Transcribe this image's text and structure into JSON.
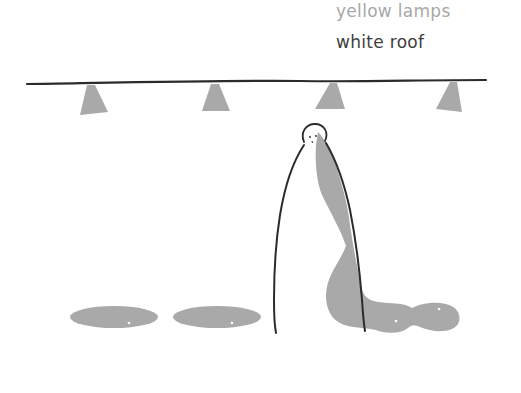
{
  "labels": {
    "yellow_lamps": "yellow lamps",
    "white_roof": "white roof"
  },
  "colors": {
    "ink": "#2b2b2b",
    "shade": "#a9a9a9",
    "label_light": "#a7a7a7",
    "label_dark": "#3d3d3d",
    "background": "#ffffff"
  },
  "scene": {
    "lamp_count": 4,
    "shadow_count": 3
  }
}
